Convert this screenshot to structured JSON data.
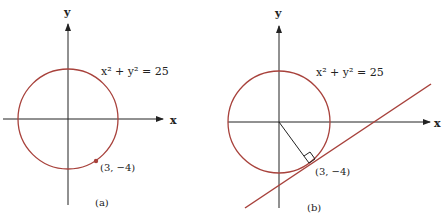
{
  "colors": {
    "curve": "#a8423c",
    "axis": "#222222",
    "background": "#ffffff"
  },
  "panels": [
    {
      "id": "a",
      "caption": "(a)",
      "equation": "x² + y² = 25",
      "x_axis_label": "x",
      "y_axis_label": "y",
      "point_label": "(3, −4)",
      "point": [
        3,
        -4
      ],
      "circle_radius": 5
    },
    {
      "id": "b",
      "caption": "(b)",
      "equation": "x² + y² = 25",
      "x_axis_label": "x",
      "y_axis_label": "y",
      "point_label": "(3, −4)",
      "point": [
        3,
        -4
      ],
      "circle_radius": 5,
      "tangent_line": "tangent at (3, −4), slope 3/4",
      "radius_segment": "from origin to (3, −4), with right-angle marker"
    }
  ]
}
